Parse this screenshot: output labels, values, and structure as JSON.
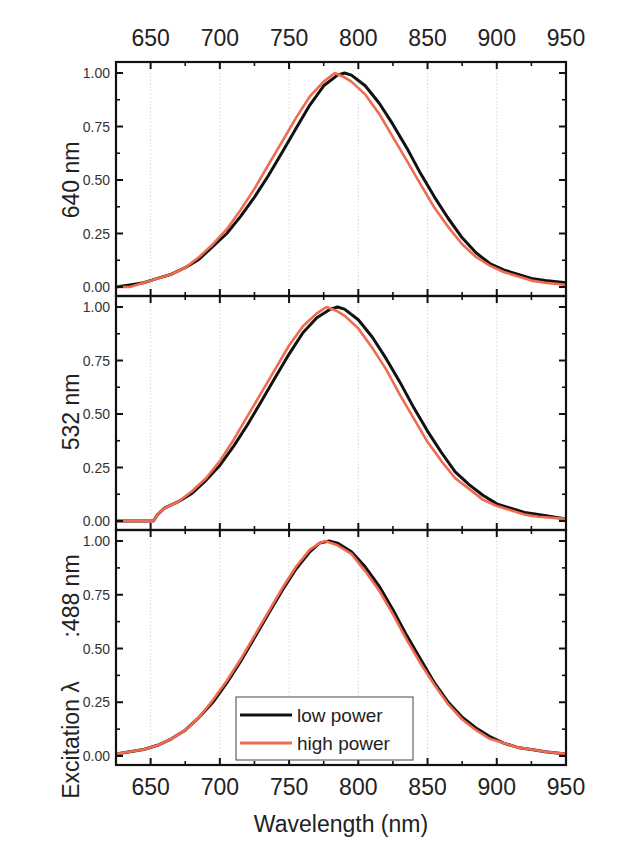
{
  "chart_data": {
    "type": "line",
    "layout": "three vertically stacked panels sharing x-axis",
    "xlabel": "Wavelength (nm)",
    "xlim": [
      625,
      950
    ],
    "x_ticks": [
      650,
      700,
      750,
      800,
      850,
      900,
      950
    ],
    "top_x_ticks": [
      650,
      700,
      750,
      800,
      850,
      900,
      950
    ],
    "y_ticks": [
      "0.00",
      "0.25",
      "0.50",
      "0.75",
      "1.00"
    ],
    "ylim": [
      0,
      1.0
    ],
    "grid": "vertical dotted lines at major x ticks",
    "legend": {
      "position": "bottom panel, lower center",
      "entries": [
        {
          "label": "low power",
          "color": "#111111"
        },
        {
          "label": "high power",
          "color": "#f26b4f"
        }
      ]
    },
    "colors": {
      "low_power": "#111111",
      "high_power": "#f26b4f"
    },
    "panels": [
      {
        "ylabel": "640 nm",
        "series": [
          {
            "name": "low power",
            "peak_nm": 788,
            "x": [
              625,
              635,
              645,
              655,
              665,
              675,
              685,
              695,
              705,
              715,
              725,
              735,
              745,
              755,
              765,
              775,
              785,
              790,
              795,
              805,
              815,
              825,
              835,
              845,
              855,
              865,
              875,
              885,
              895,
              905,
              915,
              925,
              935,
              950
            ],
            "y": [
              0.0,
              0.01,
              0.02,
              0.04,
              0.06,
              0.09,
              0.13,
              0.19,
              0.25,
              0.33,
              0.42,
              0.52,
              0.63,
              0.74,
              0.85,
              0.94,
              0.99,
              1.0,
              0.99,
              0.94,
              0.86,
              0.76,
              0.65,
              0.53,
              0.42,
              0.32,
              0.23,
              0.16,
              0.11,
              0.08,
              0.06,
              0.04,
              0.03,
              0.02
            ]
          },
          {
            "name": "high power",
            "peak_nm": 783,
            "x": [
              625,
              635,
              645,
              655,
              665,
              675,
              685,
              695,
              705,
              715,
              725,
              735,
              745,
              755,
              765,
              775,
              783,
              790,
              795,
              805,
              815,
              825,
              835,
              845,
              855,
              865,
              875,
              885,
              895,
              905,
              915,
              925,
              935,
              950
            ],
            "y": [
              0.0,
              0.0,
              0.02,
              0.04,
              0.06,
              0.09,
              0.14,
              0.2,
              0.27,
              0.36,
              0.46,
              0.57,
              0.68,
              0.79,
              0.89,
              0.96,
              1.0,
              0.98,
              0.96,
              0.9,
              0.81,
              0.7,
              0.59,
              0.48,
              0.37,
              0.28,
              0.2,
              0.14,
              0.1,
              0.07,
              0.05,
              0.03,
              0.02,
              0.01
            ]
          }
        ]
      },
      {
        "ylabel": "532 nm",
        "series": [
          {
            "name": "low power",
            "peak_nm": 783,
            "x": [
              625,
              640,
              652,
              655,
              660,
              670,
              680,
              690,
              700,
              710,
              720,
              730,
              740,
              750,
              760,
              770,
              780,
              785,
              790,
              800,
              810,
              820,
              830,
              840,
              850,
              860,
              870,
              880,
              890,
              900,
              910,
              920,
              930,
              950
            ],
            "y": [
              0.0,
              0.0,
              0.0,
              0.03,
              0.06,
              0.09,
              0.13,
              0.19,
              0.26,
              0.35,
              0.45,
              0.56,
              0.67,
              0.78,
              0.88,
              0.95,
              0.99,
              1.0,
              0.99,
              0.94,
              0.86,
              0.76,
              0.65,
              0.53,
              0.42,
              0.32,
              0.23,
              0.17,
              0.12,
              0.08,
              0.06,
              0.04,
              0.03,
              0.01
            ]
          },
          {
            "name": "high power",
            "peak_nm": 777,
            "x": [
              625,
              640,
              652,
              655,
              660,
              670,
              680,
              690,
              700,
              710,
              720,
              730,
              740,
              750,
              760,
              770,
              777,
              785,
              790,
              800,
              810,
              820,
              830,
              840,
              850,
              860,
              870,
              880,
              890,
              900,
              910,
              920,
              930,
              950
            ],
            "y": [
              0.0,
              0.0,
              0.0,
              0.03,
              0.06,
              0.09,
              0.14,
              0.2,
              0.28,
              0.38,
              0.49,
              0.6,
              0.71,
              0.82,
              0.91,
              0.97,
              1.0,
              0.98,
              0.96,
              0.9,
              0.81,
              0.71,
              0.59,
              0.48,
              0.37,
              0.28,
              0.2,
              0.15,
              0.1,
              0.07,
              0.05,
              0.03,
              0.02,
              0.01
            ]
          }
        ]
      },
      {
        "ylabel": "Excitation λ :488 nm",
        "series": [
          {
            "name": "low power",
            "peak_nm": 779,
            "x": [
              625,
              635,
              645,
              655,
              665,
              675,
              685,
              695,
              705,
              715,
              725,
              735,
              745,
              755,
              765,
              772,
              779,
              785,
              795,
              805,
              815,
              825,
              835,
              845,
              855,
              865,
              875,
              885,
              895,
              905,
              915,
              925,
              935,
              950
            ],
            "y": [
              0.01,
              0.02,
              0.03,
              0.05,
              0.08,
              0.12,
              0.18,
              0.25,
              0.34,
              0.44,
              0.55,
              0.66,
              0.77,
              0.87,
              0.95,
              0.99,
              1.0,
              0.99,
              0.95,
              0.88,
              0.79,
              0.68,
              0.56,
              0.45,
              0.34,
              0.25,
              0.18,
              0.13,
              0.09,
              0.06,
              0.04,
              0.03,
              0.02,
              0.01
            ]
          },
          {
            "name": "high power",
            "peak_nm": 776,
            "x": [
              625,
              635,
              645,
              655,
              665,
              675,
              685,
              695,
              705,
              715,
              725,
              735,
              745,
              755,
              765,
              772,
              776,
              785,
              795,
              805,
              815,
              825,
              835,
              845,
              855,
              865,
              875,
              885,
              895,
              905,
              915,
              925,
              935,
              950
            ],
            "y": [
              0.01,
              0.02,
              0.03,
              0.05,
              0.08,
              0.12,
              0.18,
              0.26,
              0.35,
              0.45,
              0.56,
              0.67,
              0.78,
              0.88,
              0.96,
              0.99,
              1.0,
              0.98,
              0.94,
              0.86,
              0.77,
              0.66,
              0.54,
              0.43,
              0.33,
              0.24,
              0.17,
              0.12,
              0.08,
              0.06,
              0.04,
              0.03,
              0.02,
              0.01
            ]
          }
        ]
      }
    ]
  },
  "labels": {
    "xlabel": "Wavelength (nm)",
    "panel1_ylabel": "640 nm",
    "panel2_ylabel": "532 nm",
    "panel3_ylabel_part1": "Excitation λ",
    "panel3_ylabel_part2": ":488 nm",
    "legend_low": "low power",
    "legend_high": "high power"
  }
}
